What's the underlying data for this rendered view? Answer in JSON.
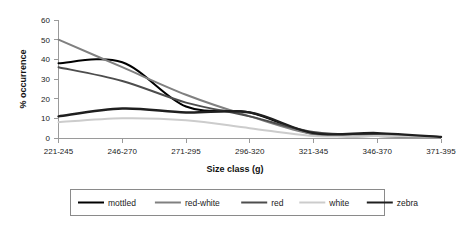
{
  "chart_data": {
    "type": "line",
    "title": "",
    "xlabel": "Size class (g)",
    "ylabel": "% occurrence",
    "categories": [
      "221-245",
      "246-270",
      "271-295",
      "296-320",
      "321-345",
      "346-370",
      "371-395"
    ],
    "ylim": [
      0,
      60
    ],
    "yticks": [
      0,
      10,
      20,
      30,
      40,
      50,
      60
    ],
    "grid": false,
    "smoothed": true,
    "legend_position": "bottom",
    "series": [
      {
        "name": "mottled",
        "color": "#000000",
        "width": 2.0,
        "values": [
          38,
          38.5,
          16,
          13,
          2,
          1,
          0.5
        ]
      },
      {
        "name": "red-white",
        "color": "#808080",
        "width": 2.0,
        "values": [
          50,
          36,
          22,
          11,
          2,
          1,
          0.5
        ]
      },
      {
        "name": "red",
        "color": "#4d4d4d",
        "width": 2.0,
        "values": [
          36,
          29,
          18,
          11,
          3,
          1.5,
          0.5
        ]
      },
      {
        "name": "white",
        "color": "#cccccc",
        "width": 2.0,
        "values": [
          8,
          10,
          9,
          5,
          1,
          1,
          0.5
        ]
      },
      {
        "name": "zebra",
        "color": "#1f1f1f",
        "width": 2.4,
        "values": [
          11,
          15,
          13,
          13,
          2.5,
          2.5,
          0.5
        ]
      }
    ]
  },
  "axes": {
    "y_tick_labels": [
      "60",
      "50",
      "40",
      "30",
      "20",
      "10",
      "0"
    ],
    "y_axis_title": "% occurrence",
    "x_axis_title": "Size class (g)",
    "x_tick_labels": [
      "221-245",
      "246-270",
      "271-295",
      "296-320",
      "321-345",
      "346-370",
      "371-395"
    ]
  },
  "legend": {
    "items": [
      {
        "label": "mottled",
        "color": "#000000"
      },
      {
        "label": "red-white",
        "color": "#808080"
      },
      {
        "label": "red",
        "color": "#4d4d4d"
      },
      {
        "label": "white",
        "color": "#cccccc"
      },
      {
        "label": "zebra",
        "color": "#1f1f1f"
      }
    ]
  }
}
